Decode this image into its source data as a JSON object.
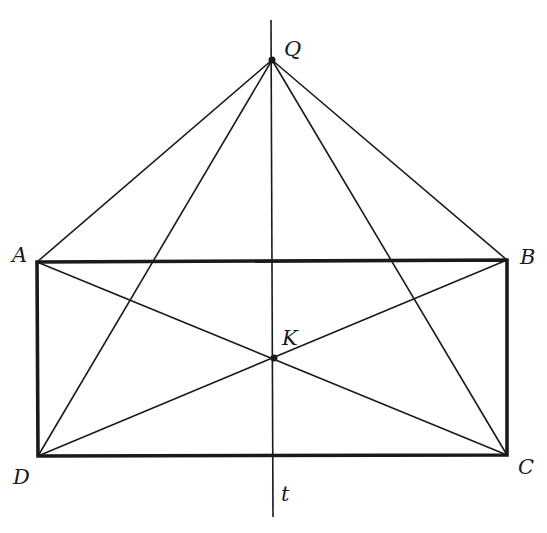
{
  "figure": {
    "type": "geometry",
    "colors": {
      "stroke": "#1a1a1a",
      "background": "#ffffff"
    },
    "points": {
      "Q": {
        "label": "Q",
        "x": 272,
        "y": 60
      },
      "A": {
        "label": "A",
        "x": 37,
        "y": 262
      },
      "B": {
        "label": "B",
        "x": 507,
        "y": 260
      },
      "C": {
        "label": "C",
        "x": 507,
        "y": 455
      },
      "D": {
        "label": "D",
        "x": 38,
        "y": 456
      },
      "K": {
        "label": "K",
        "x": 274,
        "y": 358
      }
    },
    "line_t": {
      "label": "t"
    },
    "labels": {
      "Q": "Q",
      "A": "A",
      "B": "B",
      "C": "C",
      "D": "D",
      "K": "K",
      "t": "t"
    }
  }
}
